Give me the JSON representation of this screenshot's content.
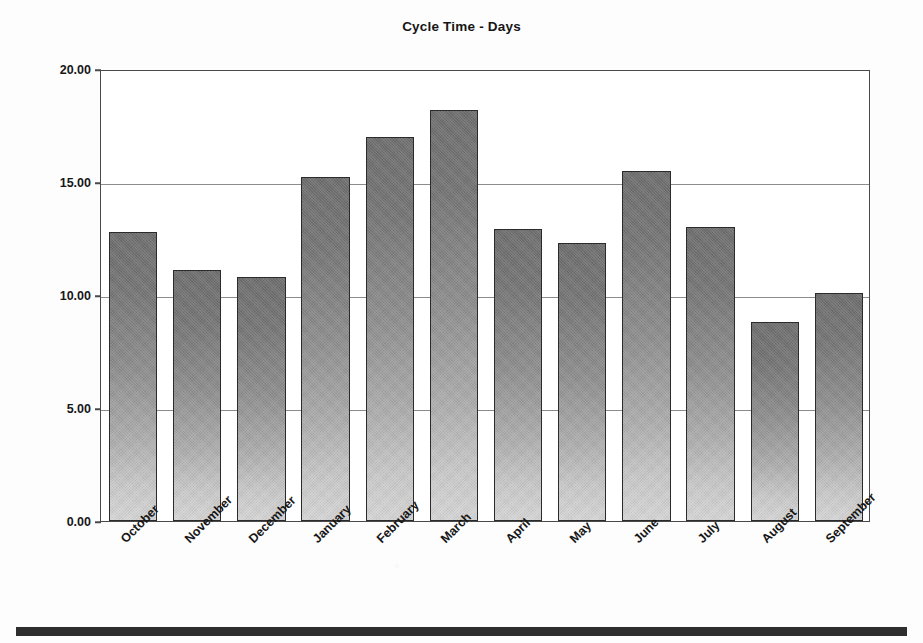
{
  "chart_data": {
    "type": "bar",
    "title": "Cycle Time - Days",
    "xlabel": "",
    "ylabel": "",
    "categories": [
      "October",
      "November",
      "December",
      "January",
      "February",
      "March",
      "April",
      "May",
      "June",
      "July",
      "August",
      "September"
    ],
    "values": [
      12.8,
      11.1,
      10.8,
      15.2,
      17.0,
      18.2,
      12.9,
      12.3,
      15.5,
      13.0,
      8.8,
      10.1
    ],
    "ylim": [
      0,
      20
    ],
    "yticks": [
      0,
      5,
      10,
      15,
      20
    ],
    "ytick_labels": [
      "0.00",
      "5.00",
      "10.00",
      "15.00",
      "20.00"
    ],
    "grid": true,
    "grid_axis": "y",
    "legend": false,
    "legend_position": "none",
    "bar_fill": "#8f8f8f",
    "bar_edge": "#2b2b2b",
    "xtick_rotation": -45
  },
  "page": {
    "background": "#fdfdfd",
    "footer_rule_color": "#2e2e2e"
  }
}
